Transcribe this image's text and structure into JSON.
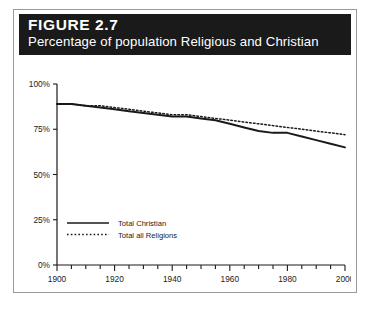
{
  "figure": {
    "number_label": "FIGURE 2.7",
    "subtitle": "Percentage of population Religious and Christian"
  },
  "chart_data": {
    "type": "line",
    "title": "Percentage of population Religious and Christian",
    "xlabel": "",
    "ylabel": "",
    "xlim": [
      1900,
      2000
    ],
    "ylim": [
      0,
      100
    ],
    "grid": false,
    "legend_position": "bottom-left",
    "x_ticks_major": [
      1900,
      1920,
      1940,
      1960,
      1980,
      2000
    ],
    "x_ticks_minor_step": 5,
    "x_tick_labels": [
      "1900",
      "1920",
      "1940",
      "1960",
      "1980",
      "2000"
    ],
    "y_ticks": [
      0,
      25,
      50,
      75,
      100
    ],
    "y_tick_labels": [
      "0%",
      "25%",
      "50%",
      "75%",
      "100%"
    ],
    "x": [
      1900,
      1905,
      1910,
      1915,
      1920,
      1925,
      1930,
      1935,
      1940,
      1945,
      1950,
      1955,
      1960,
      1965,
      1970,
      1975,
      1980,
      1985,
      1990,
      1995,
      2000
    ],
    "series": [
      {
        "name": "Total Christian",
        "style": "solid",
        "color": "#1a1a1a",
        "values": [
          89,
          89,
          88,
          87,
          86,
          85,
          84,
          83,
          82,
          82,
          81,
          80,
          78,
          76,
          74,
          73,
          73,
          71,
          69,
          67,
          65
        ]
      },
      {
        "name": "Total all Religions",
        "style": "dotted",
        "color": "#1a1a1a",
        "values": [
          89,
          89,
          88,
          88,
          87,
          86,
          85,
          84,
          83,
          83,
          82,
          81,
          80,
          79,
          78,
          77,
          76,
          75,
          74,
          73,
          72
        ]
      }
    ],
    "legend": [
      {
        "label": "Total Christian",
        "style": "solid"
      },
      {
        "label": "Total all Religions",
        "style": "dotted"
      }
    ]
  }
}
